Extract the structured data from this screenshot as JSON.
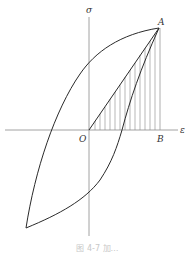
{
  "diagram": {
    "type": "stress-strain hysteresis loop",
    "axes": {
      "y_label": "σ",
      "x_label": "ε",
      "origin_label": "O"
    },
    "points": {
      "A": "A",
      "B": "B"
    },
    "shaded_region": "triangle O-A-B (vertical hatching)",
    "caption": "图 4-7  加…"
  },
  "colors": {
    "curve": "#2a2a2a",
    "axis": "#8a8a8a",
    "hatch": "#9a9a9a"
  }
}
